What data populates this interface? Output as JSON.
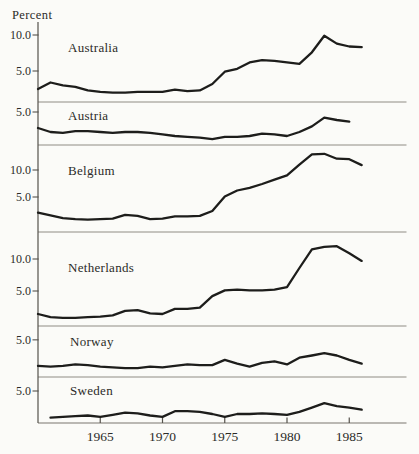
{
  "figure": {
    "y_axis_title": "Percent"
  },
  "chart_data": {
    "type": "line",
    "title": "Percent",
    "ylabel": "Percent",
    "unit": "percent",
    "grid": false,
    "legend": "none",
    "line_color": "#1d1d1b",
    "axis_color": "#55524c",
    "separator_color": "#8f8c84",
    "text_color": "#2b2b28",
    "background": "#fbfbf8",
    "years": [
      1960,
      1961,
      1962,
      1963,
      1964,
      1965,
      1966,
      1967,
      1968,
      1969,
      1970,
      1971,
      1972,
      1973,
      1974,
      1975,
      1976,
      1977,
      1978,
      1979,
      1980,
      1981,
      1982,
      1983,
      1984,
      1985,
      1986
    ],
    "x_ticks": [
      {
        "year": 1965,
        "label": "1965"
      },
      {
        "year": 1970,
        "label": "1970"
      },
      {
        "year": 1975,
        "label": "1975"
      },
      {
        "year": 1980,
        "label": "1980"
      },
      {
        "year": 1985,
        "label": "1985"
      }
    ],
    "panels": [
      {
        "country": "Australia",
        "yticks": [
          {
            "value": 10.0,
            "label": "10.0"
          },
          {
            "value": 5.0,
            "label": "5.0"
          }
        ],
        "ylim": [
          0,
          11.8
        ],
        "values": [
          2.5,
          3.4,
          3.0,
          2.8,
          2.3,
          2.1,
          2.0,
          2.0,
          2.1,
          2.1,
          2.1,
          2.4,
          2.2,
          2.3,
          3.2,
          4.9,
          5.3,
          6.2,
          6.5,
          6.4,
          6.2,
          6.0,
          7.6,
          9.9,
          8.8,
          8.4,
          8.3
        ]
      },
      {
        "country": "Austria",
        "yticks": [
          {
            "value": 5.0,
            "label": "5.0"
          }
        ],
        "ylim": [
          0,
          6.2
        ],
        "values": [
          3.0,
          2.5,
          2.4,
          2.6,
          2.6,
          2.5,
          2.4,
          2.5,
          2.5,
          2.4,
          2.2,
          2.0,
          1.9,
          1.8,
          1.6,
          1.9,
          1.9,
          2.0,
          2.3,
          2.2,
          2.0,
          2.5,
          3.2,
          4.3,
          4.0,
          3.8,
          null
        ]
      },
      {
        "country": "Belgium",
        "yticks": [
          {
            "value": 10.0,
            "label": "10.0"
          },
          {
            "value": 5.0,
            "label": "5.0"
          }
        ],
        "ylim": [
          0,
          14.6
        ],
        "values": [
          2.1,
          1.6,
          1.1,
          0.9,
          0.8,
          0.9,
          1.0,
          1.7,
          1.5,
          0.9,
          1.0,
          1.4,
          1.4,
          1.5,
          2.4,
          5.1,
          6.2,
          6.7,
          7.4,
          8.2,
          9.0,
          11.0,
          12.9,
          13.0,
          12.1,
          12.0,
          10.9
        ]
      },
      {
        "country": "Netherlands",
        "yticks": [
          {
            "value": 10.0,
            "label": "10.0"
          },
          {
            "value": 5.0,
            "label": "5.0"
          }
        ],
        "ylim": [
          0,
          14.2
        ],
        "values": [
          1.4,
          0.9,
          0.8,
          0.8,
          0.9,
          1.0,
          1.2,
          1.9,
          2.0,
          1.5,
          1.4,
          2.2,
          2.2,
          2.4,
          4.2,
          5.1,
          5.2,
          5.1,
          5.1,
          5.2,
          5.6,
          8.6,
          11.5,
          11.9,
          12.0,
          10.9,
          9.7
        ]
      },
      {
        "country": "Norway",
        "yticks": [
          {
            "value": 5.0,
            "label": "5.0"
          }
        ],
        "ylim": [
          0,
          6.6
        ],
        "values": [
          1.5,
          1.4,
          1.5,
          1.7,
          1.6,
          1.4,
          1.3,
          1.2,
          1.2,
          1.4,
          1.3,
          1.5,
          1.7,
          1.6,
          1.6,
          2.3,
          1.8,
          1.4,
          1.9,
          2.1,
          1.7,
          2.6,
          2.9,
          3.2,
          2.9,
          2.3,
          1.8
        ]
      },
      {
        "country": "Sweden",
        "yticks": [
          {
            "value": 5.0,
            "label": "5.0"
          }
        ],
        "ylim": [
          0,
          6.9
        ],
        "values": [
          null,
          1.3,
          1.4,
          1.5,
          1.6,
          1.4,
          1.7,
          2.0,
          1.9,
          1.6,
          1.4,
          2.2,
          2.2,
          2.1,
          1.8,
          1.4,
          1.8,
          1.8,
          1.9,
          1.8,
          1.7,
          2.1,
          2.7,
          3.3,
          2.9,
          2.7,
          2.4
        ]
      }
    ]
  }
}
